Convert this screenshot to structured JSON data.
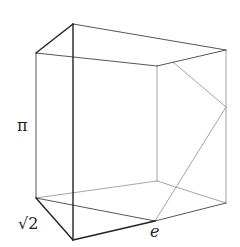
{
  "diagram": {
    "title": "",
    "labels": {
      "height": "π",
      "depth": "√2",
      "cut_point": "e"
    },
    "colors": {
      "dark_edge": "#222222",
      "mid_edge": "#555555",
      "light_edge": "#9a9a9a",
      "background": "#ffffff"
    },
    "vertices": {
      "front_top": [
        73,
        24
      ],
      "front_bottom": [
        73,
        240
      ],
      "left_top": [
        36,
        53
      ],
      "left_bottom": [
        36,
        198
      ],
      "right_top": [
        226,
        50
      ],
      "right_bottom": [
        226,
        203
      ],
      "inner_top": [
        157,
        66
      ],
      "inner_bottom": [
        157,
        181
      ],
      "cut_top": [
        173,
        62
      ],
      "cut_right": [
        226,
        107
      ],
      "cut_bottom_e": [
        155,
        221
      ]
    }
  }
}
